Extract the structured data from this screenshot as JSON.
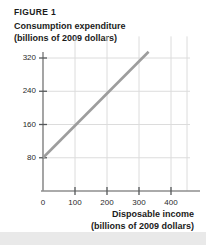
{
  "figure": {
    "label": "FIGURE 1"
  },
  "chart_data": {
    "type": "line",
    "title": "FIGURE 1",
    "ylabel_line1": "Consumption expenditure",
    "ylabel_line2": "(billions of 2009 dollars)",
    "xlabel_line1": "Disposable income",
    "xlabel_line2": "(billions of 2009 dollars)",
    "xlim": [
      0,
      450
    ],
    "ylim": [
      0,
      360
    ],
    "xticks": [
      0,
      100,
      200,
      300,
      400
    ],
    "xtick_labels": [
      "0",
      "100",
      "200",
      "300",
      "400"
    ],
    "yticks": [
      80,
      160,
      240,
      320
    ],
    "ytick_labels": [
      "80",
      "160",
      "240",
      "320"
    ],
    "grid": true,
    "legend": "none",
    "series": [
      {
        "name": "consumption function",
        "color": "#9d9d9d",
        "x": [
          0,
          330
        ],
        "y": [
          80,
          335
        ],
        "slope": 0.773,
        "intercept": 80
      }
    ],
    "colors": {
      "line": "#9d9d9d",
      "grid": "#dcdcdc",
      "axis": "#8e8e8e",
      "text": "#1b1b1b",
      "background": "#ffffff",
      "bottom_band": "#e9e9e9"
    }
  }
}
